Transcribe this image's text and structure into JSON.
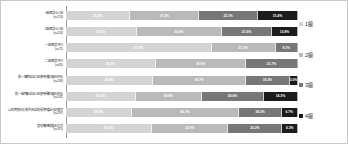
{
  "chart_data": {
    "type": "bar",
    "title": "",
    "xlabel": "",
    "ylabel": "",
    "orientation": "horizontal",
    "stacked": true,
    "normalized_percent": true,
    "xlim": [
      0,
      100
    ],
    "grid": false,
    "legend_position": "right",
    "categories": [
      "一級相談G-CM",
      "二級相談G-CM",
      "一級相談TPO",
      "二級相談TPO",
      "前一階期並並CM使用遊記資料預防",
      "前一階期未並並CM使用後的資料預防",
      "公的期針対応業外周並前長期地話行記保守",
      "其他構把成績合方式"
    ],
    "category_counts": [
      "(n=724)",
      "(n=526)",
      "(n=72)",
      "(n=85)",
      "(n=208)",
      "(n=532)",
      "(n=297)",
      "(n=375)"
    ],
    "series": [
      {
        "name": "1級",
        "color": "#d4d4d4",
        "values": [
          25.4,
          30.5,
          61.8,
          38.3,
          36.4,
          30.0,
          28.5,
          37.0
        ]
      },
      {
        "name": "2級",
        "color": "#b9b9b9",
        "values": [
          27.2,
          36.9,
          27.2,
          38.5,
          38.7,
          28.8,
          46.7,
          32.9
        ]
      },
      {
        "name": "3級",
        "color": "#777777",
        "values": [
          23.1,
          21.6,
          9.1,
          21.7,
          18.3,
          26.6,
          18.3,
          23.2
        ]
      },
      {
        "name": "4級",
        "color": "#1c1c1c",
        "values": [
          15.4,
          10.8,
          0.0,
          0.0,
          3.0,
          14.3,
          6.7,
          6.3
        ]
      }
    ],
    "value_labels": [
      [
        "25.4%",
        "27.2%",
        "23.1%",
        "15.4%"
      ],
      [
        "30.5%",
        "36.9%",
        "21.6%",
        "10.8%"
      ],
      [
        "61.8%",
        "27.2%",
        "9.1%",
        ""
      ],
      [
        "38.3%",
        "38.5%",
        "21.7%",
        ""
      ],
      [
        "36.4%",
        "38.7%",
        "18.3%",
        "3.0%"
      ],
      [
        "30.0%",
        "28.8%",
        "26.6%",
        "14.3%"
      ],
      [
        "28.5%",
        "46.7%",
        "18.3%",
        "6.7%"
      ],
      [
        "37.0%",
        "32.9%",
        "23.2%",
        "6.3%"
      ]
    ]
  },
  "legend": {
    "items": [
      {
        "label": "1級",
        "color": "#d4d4d4"
      },
      {
        "label": "2級",
        "color": "#b9b9b9"
      },
      {
        "label": "3級",
        "color": "#777777"
      },
      {
        "label": "4級",
        "color": "#1c1c1c"
      }
    ]
  }
}
